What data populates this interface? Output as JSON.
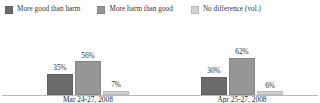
{
  "chart_data": {
    "type": "bar",
    "title": "",
    "subtitle": "",
    "xlabel": "",
    "ylabel": "",
    "ylim": [
      0,
      100
    ],
    "grid": false,
    "legend_position": "top-left",
    "categories": [
      "Mar 24-27, 2008",
      "Apr 25-27, 2008"
    ],
    "series": [
      {
        "name": "More good than harm",
        "color": "#6b6b6b",
        "values": [
          35,
          30
        ],
        "labels": [
          "35%",
          "30%"
        ]
      },
      {
        "name": "More harm than good",
        "color": "#969696",
        "values": [
          56,
          62
        ],
        "labels": [
          "56%",
          "62%"
        ]
      },
      {
        "name": "No difference (vol.)",
        "color": "#d2d2d2",
        "values": [
          7,
          6
        ],
        "labels": [
          "7%",
          "6%"
        ]
      }
    ]
  },
  "legend": {
    "items": [
      {
        "label": "More good than harm",
        "color": "#6b6b6b"
      },
      {
        "label": "More harm than good",
        "color": "#969696"
      },
      {
        "label": "No difference (vol.)",
        "color": "#d2d2d2"
      }
    ]
  },
  "axis": {
    "categories": [
      "Mar 24-27, 2008",
      "Apr 25-27, 2008"
    ],
    "baseline_color": "#b9b9b9"
  }
}
